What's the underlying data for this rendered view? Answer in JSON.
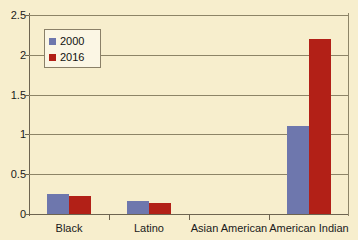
{
  "chart_data": {
    "type": "bar",
    "title": "",
    "xlabel": "",
    "ylabel": "",
    "categories": [
      "Black",
      "Latino",
      "Asian American",
      "American Indian"
    ],
    "series": [
      {
        "name": "2000",
        "color": "#6e77ad",
        "values": [
          0.25,
          0.16,
          0.0,
          1.1
        ]
      },
      {
        "name": "2016",
        "color": "#b22017",
        "values": [
          0.23,
          0.14,
          0.0,
          2.2
        ]
      }
    ],
    "ylim": [
      0,
      2.5
    ],
    "yticks": [
      "0",
      "0.5",
      "1",
      "1.5",
      "2",
      "2.5"
    ],
    "ytick_values": [
      0,
      0.5,
      1,
      1.5,
      2,
      2.5
    ],
    "grid": true,
    "legend_position": "upper-left",
    "background_color": "#f7eecd",
    "gridline_color": "#8d8467",
    "axis_color": "#6d6450"
  },
  "legend": {
    "entries": [
      {
        "label": "2000",
        "color": "#6e77ad"
      },
      {
        "label": "2016",
        "color": "#b22017"
      }
    ]
  }
}
